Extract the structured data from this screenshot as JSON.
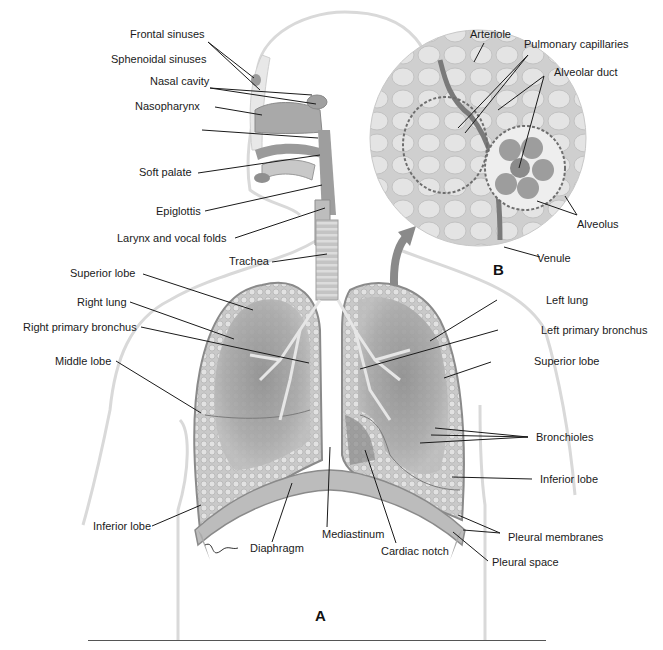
{
  "figure": {
    "panel_a_label": "A",
    "panel_b_label": "B"
  },
  "labels_head": {
    "frontal_sinuses": "Frontal sinuses",
    "sphenoidal_sinuses": "Sphenoidal sinuses",
    "nasal_cavity": "Nasal cavity",
    "nasopharynx": "Nasopharynx",
    "soft_palate": "Soft palate",
    "epiglottis": "Epiglottis",
    "larynx": "Larynx and vocal folds",
    "trachea": "Trachea"
  },
  "labels_right_side": {
    "superior_lobe": "Superior lobe",
    "right_lung": "Right lung",
    "right_primary_bronchus": "Right primary bronchus",
    "middle_lobe": "Middle lobe",
    "inferior_lobe": "Inferior lobe"
  },
  "labels_left_side": {
    "left_lung": "Left lung",
    "left_primary_bronchus": "Left primary bronchus",
    "superior_lobe": "Superior lobe",
    "bronchioles": "Bronchioles",
    "inferior_lobe": "Inferior lobe",
    "pleural_membranes": "Pleural membranes",
    "pleural_space": "Pleural space"
  },
  "labels_bottom": {
    "diaphragm": "Diaphragm",
    "mediastinum": "Mediastinum",
    "cardiac_notch": "Cardiac notch"
  },
  "labels_inset": {
    "arteriole": "Arteriole",
    "pulmonary_capillaries": "Pulmonary capillaries",
    "alveolar_duct": "Alveolar duct",
    "alveolus": "Alveolus",
    "venule": "Venule"
  },
  "colors": {
    "body_outline": "#d6d6d6",
    "lung_fill": "#b8b8b8",
    "lung_dark": "#8e8e8e",
    "inset_fill": "#d8d8d8",
    "leader_line": "#1a1a1a"
  }
}
